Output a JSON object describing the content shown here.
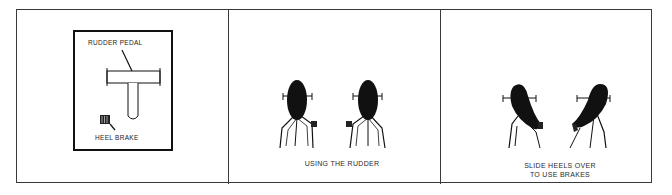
{
  "figure": {
    "panels": [
      {
        "id": "pedal-detail",
        "labels": {
          "rudder_pedal": "RUDDER PEDAL",
          "heel_brake": "HEEL BRAKE"
        }
      },
      {
        "id": "using-rudder",
        "caption": "USING THE RUDDER"
      },
      {
        "id": "using-brakes",
        "caption_line1": "SLIDE HEELS OVER",
        "caption_line2": "TO USE BRAKES"
      }
    ],
    "colors": {
      "ink": "#111111",
      "border": "#3a3a3a",
      "background": "#ffffff"
    }
  }
}
